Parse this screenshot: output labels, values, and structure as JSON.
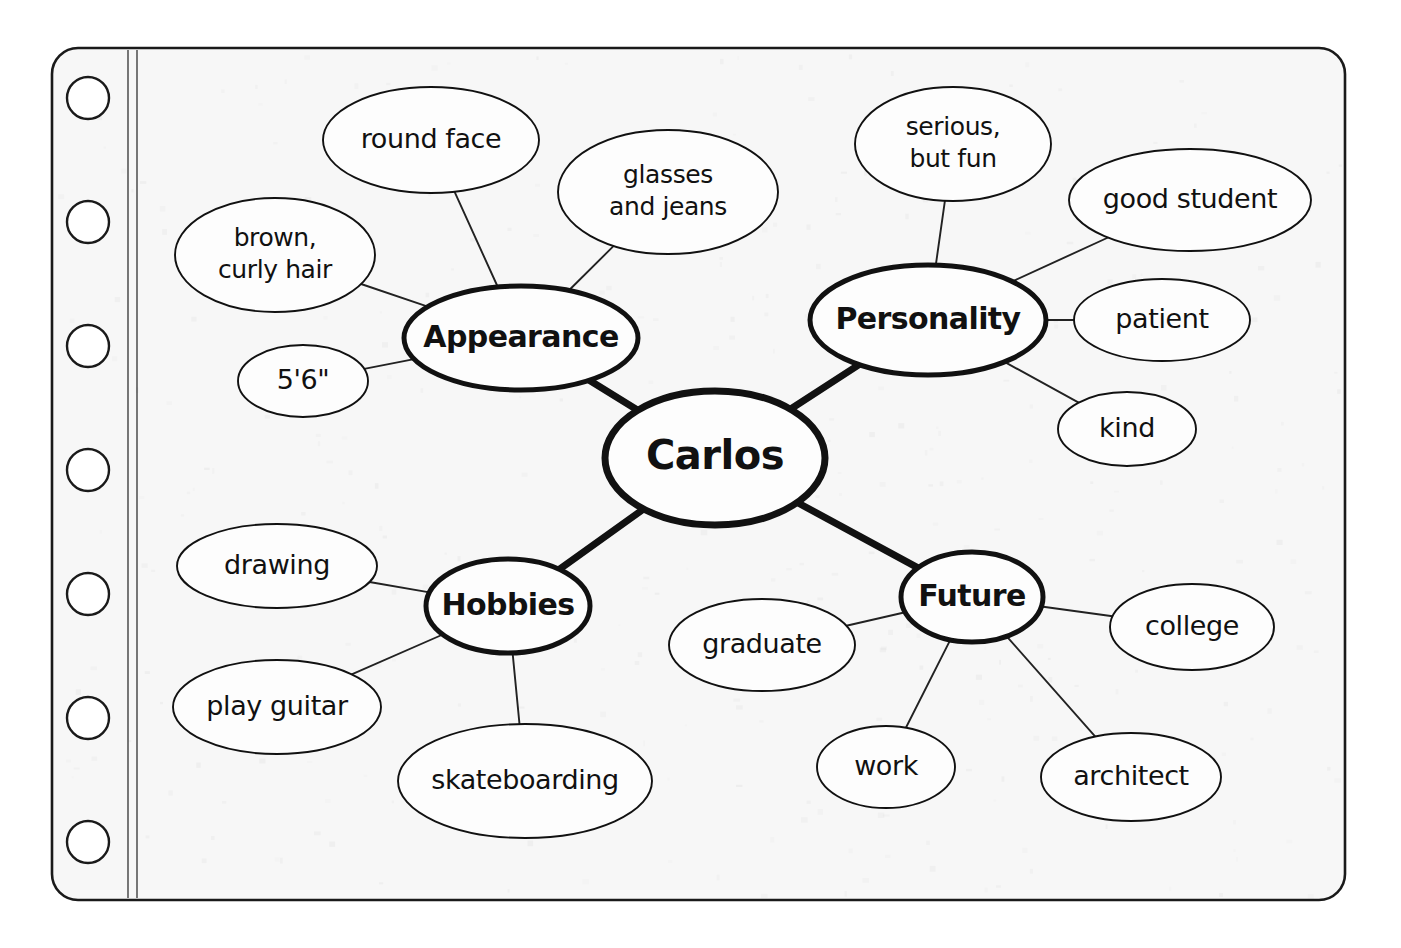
{
  "page": {
    "paper": {
      "fill": "#f7f7f7",
      "stroke": "#1a1a1a",
      "x": 52,
      "y": 48,
      "width": 1293,
      "height": 852,
      "corner_radius": 26
    },
    "margin_lines": [
      {
        "x": 128,
        "label": "margin-line-inner"
      },
      {
        "x": 137,
        "label": "margin-line-outer"
      }
    ],
    "punch_holes": {
      "count": 7,
      "cx": 88,
      "r": 21,
      "cy_values": [
        98,
        222,
        346,
        470,
        594,
        718,
        842
      ]
    }
  },
  "colors": {
    "ink": "#111111",
    "paper": "#f7f7f7",
    "outer_background": "#ffffff",
    "thin_stroke": "#222222"
  },
  "mindmap": {
    "center": {
      "id": "carlos",
      "label": "Carlos",
      "cx": 715,
      "cy": 458,
      "rx": 110,
      "ry": 67,
      "stroke_width": 7
    },
    "branches": [
      {
        "id": "appearance",
        "label": "Appearance",
        "cx": 521,
        "cy": 338,
        "rx": 117,
        "ry": 52,
        "stroke_width": 5,
        "leaves": [
          {
            "id": "round-face",
            "label": "round face",
            "cx": 431,
            "cy": 140,
            "rx": 108,
            "ry": 53,
            "lines": [
              "round face"
            ]
          },
          {
            "id": "glasses-and-jeans",
            "label": "glasses and jeans",
            "cx": 668,
            "cy": 192,
            "rx": 110,
            "ry": 62,
            "lines": [
              "glasses",
              "and jeans"
            ]
          },
          {
            "id": "brown-curly-hair",
            "label": "brown, curly hair",
            "cx": 275,
            "cy": 255,
            "rx": 100,
            "ry": 57,
            "lines": [
              "brown,",
              "curly hair"
            ]
          },
          {
            "id": "height",
            "label": "5'6\"",
            "cx": 303,
            "cy": 381,
            "rx": 65,
            "ry": 36,
            "lines": [
              "5'6\""
            ]
          }
        ]
      },
      {
        "id": "personality",
        "label": "Personality",
        "cx": 928,
        "cy": 320,
        "rx": 118,
        "ry": 55,
        "stroke_width": 5,
        "leaves": [
          {
            "id": "serious-but-fun",
            "label": "serious, but fun",
            "cx": 953,
            "cy": 144,
            "rx": 98,
            "ry": 57,
            "lines": [
              "serious,",
              "but fun"
            ]
          },
          {
            "id": "good-student",
            "label": "good student",
            "cx": 1190,
            "cy": 200,
            "rx": 121,
            "ry": 51,
            "lines": [
              "good student"
            ]
          },
          {
            "id": "patient",
            "label": "patient",
            "cx": 1162,
            "cy": 320,
            "rx": 88,
            "ry": 41,
            "lines": [
              "patient"
            ]
          },
          {
            "id": "kind",
            "label": "kind",
            "cx": 1127,
            "cy": 429,
            "rx": 69,
            "ry": 37,
            "lines": [
              "kind"
            ]
          }
        ]
      },
      {
        "id": "hobbies",
        "label": "Hobbies",
        "cx": 508,
        "cy": 606,
        "rx": 82,
        "ry": 47,
        "stroke_width": 5,
        "leaves": [
          {
            "id": "drawing",
            "label": "drawing",
            "cx": 277,
            "cy": 566,
            "rx": 100,
            "ry": 42,
            "lines": [
              "drawing"
            ]
          },
          {
            "id": "play-guitar",
            "label": "play guitar",
            "cx": 277,
            "cy": 707,
            "rx": 104,
            "ry": 47,
            "lines": [
              "play guitar"
            ]
          },
          {
            "id": "skateboarding",
            "label": "skateboarding",
            "cx": 525,
            "cy": 781,
            "rx": 127,
            "ry": 57,
            "lines": [
              "skateboarding"
            ]
          }
        ]
      },
      {
        "id": "future",
        "label": "Future",
        "cx": 972,
        "cy": 597,
        "rx": 71,
        "ry": 45,
        "stroke_width": 5,
        "leaves": [
          {
            "id": "graduate",
            "label": "graduate",
            "cx": 762,
            "cy": 645,
            "rx": 93,
            "ry": 46,
            "lines": [
              "graduate"
            ]
          },
          {
            "id": "college",
            "label": "college",
            "cx": 1192,
            "cy": 627,
            "rx": 82,
            "ry": 43,
            "lines": [
              "college"
            ]
          },
          {
            "id": "work",
            "label": "work",
            "cx": 886,
            "cy": 767,
            "rx": 69,
            "ry": 41,
            "lines": [
              "work"
            ]
          },
          {
            "id": "architect",
            "label": "architect",
            "cx": 1131,
            "cy": 777,
            "rx": 90,
            "ry": 44,
            "lines": [
              "architect"
            ]
          }
        ]
      }
    ]
  }
}
